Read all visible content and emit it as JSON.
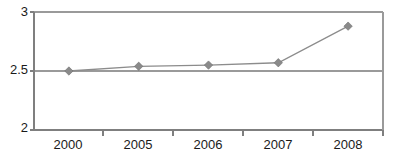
{
  "chart_data": {
    "type": "line",
    "title": "",
    "xlabel": "",
    "ylabel": "",
    "categories": [
      "2000",
      "2005",
      "2006",
      "2007",
      "2008"
    ],
    "values": [
      2.5,
      2.54,
      2.55,
      2.57,
      2.88
    ],
    "series": [
      {
        "name": "",
        "values": [
          2.5,
          2.54,
          2.55,
          2.57,
          2.88
        ],
        "marker": "diamond",
        "color": "#8a8a8a"
      }
    ],
    "ylim": [
      2,
      3
    ],
    "yticks": [
      2,
      2.5,
      3
    ],
    "ytick_labels": [
      "2",
      "2.5",
      "3"
    ],
    "xtick_labels": [
      "2000",
      "2005",
      "2006",
      "2007",
      "2008"
    ],
    "grid": true,
    "grid_axis": "y",
    "legend": false,
    "legend_position": "none",
    "colors": {
      "line": "#8c8c8c",
      "marker": "#8a8a8a",
      "axis": "#7f7f7f",
      "grid": "#9a9a9a",
      "text": "#1a1a1a",
      "background": "#ffffff"
    }
  }
}
